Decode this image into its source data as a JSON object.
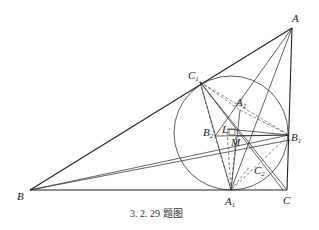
{
  "caption": "3. 2. 29 题图",
  "points": {
    "A": {
      "label": "A",
      "sub": ""
    },
    "B": {
      "label": "B",
      "sub": ""
    },
    "C": {
      "label": "C",
      "sub": ""
    },
    "A1": {
      "label": "A",
      "sub": "1"
    },
    "B1": {
      "label": "B",
      "sub": "1"
    },
    "C1": {
      "label": "C",
      "sub": "1"
    },
    "A2": {
      "label": "A",
      "sub": "2"
    },
    "B2": {
      "label": "B",
      "sub": "2"
    },
    "C2": {
      "label": "C",
      "sub": "2"
    },
    "L": {
      "label": "L",
      "sub": ""
    },
    "M": {
      "label": "M",
      "sub": ""
    }
  },
  "colors": {
    "stroke": "#222222",
    "background": "#ffffff"
  }
}
